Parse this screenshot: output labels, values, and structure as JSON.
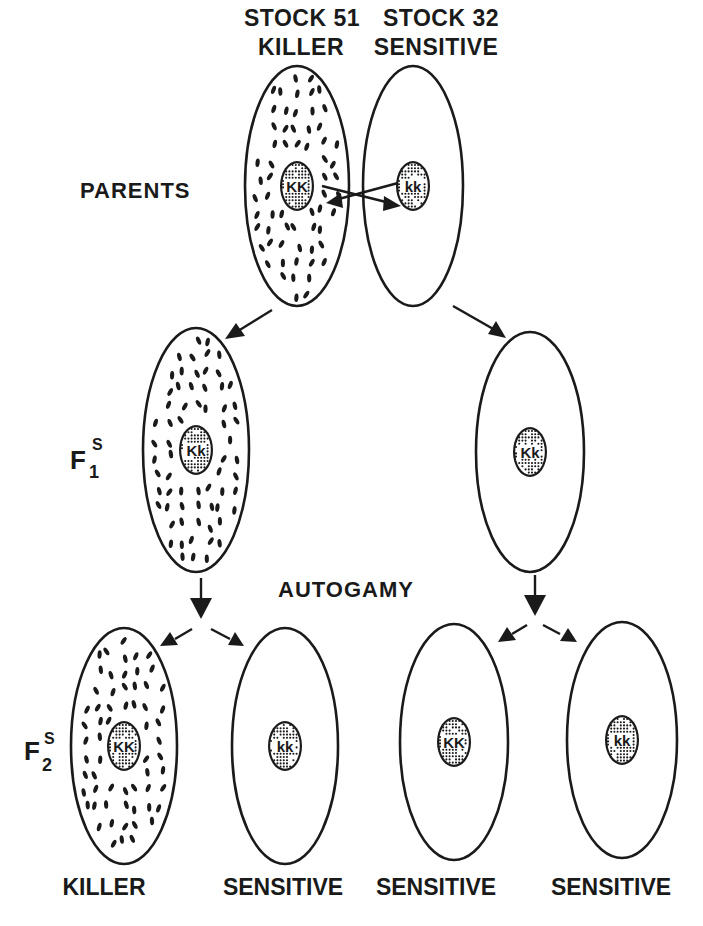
{
  "figure": {
    "background": "#ffffff",
    "ink": "#1a1a1a"
  },
  "header": {
    "left_stock": "STOCK 51",
    "left_type": "KILLER",
    "right_stock": "STOCK 32",
    "right_type": "SENSITIVE"
  },
  "rows": {
    "parents": "PARENTS",
    "f1": {
      "base": "F",
      "subscript": "1",
      "superscript": "S"
    },
    "autogamy": "AUTOGAMY",
    "f2": {
      "base": "F",
      "subscript": "2",
      "superscript": "S"
    }
  },
  "cells": {
    "parent_killer": {
      "genotype": "KK",
      "has_kappa": true,
      "cx": 297,
      "cy": 186,
      "rx": 52,
      "ry": 120,
      "seed": 11
    },
    "parent_sensitive": {
      "genotype": "kk",
      "has_kappa": false,
      "cx": 413,
      "cy": 186,
      "rx": 50,
      "ry": 120,
      "seed": 12
    },
    "f1_left": {
      "genotype": "Kk",
      "has_kappa": true,
      "cx": 196,
      "cy": 450,
      "rx": 53,
      "ry": 122,
      "seed": 21
    },
    "f1_right": {
      "genotype": "Kk",
      "has_kappa": false,
      "cx": 530,
      "cy": 452,
      "rx": 54,
      "ry": 120,
      "seed": 22
    },
    "f2_1": {
      "genotype": "KK",
      "has_kappa": true,
      "cx": 124,
      "cy": 746,
      "rx": 53,
      "ry": 118,
      "seed": 31
    },
    "f2_2": {
      "genotype": "kk",
      "has_kappa": false,
      "cx": 285,
      "cy": 746,
      "rx": 53,
      "ry": 118,
      "seed": 32
    },
    "f2_3": {
      "genotype": "KK",
      "has_kappa": false,
      "cx": 454,
      "cy": 742,
      "rx": 54,
      "ry": 118,
      "seed": 33
    },
    "f2_4": {
      "genotype": "kk",
      "has_kappa": false,
      "cx": 622,
      "cy": 740,
      "rx": 55,
      "ry": 118,
      "seed": 34
    }
  },
  "footer": {
    "labels": [
      "KILLER",
      "SENSITIVE",
      "SENSITIVE",
      "SENSITIVE"
    ]
  },
  "legend_meaning": {
    "kappa_particles": "cytoplasmic dots (kappa)",
    "nucleus": "stippled nucleus with genotype"
  }
}
